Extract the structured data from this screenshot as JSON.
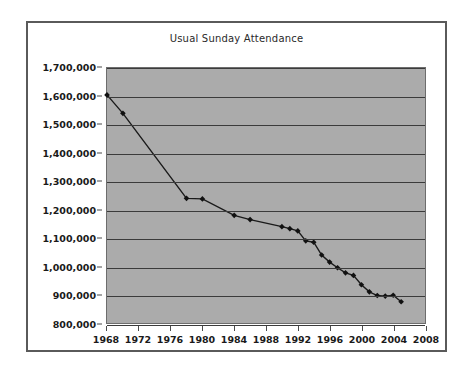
{
  "chart_data": {
    "type": "line",
    "title": "Usual Sunday Attendance",
    "xlabel": "",
    "ylabel": "",
    "xlim": [
      1968,
      2008
    ],
    "ylim": [
      800000,
      1700000
    ],
    "grid": true,
    "legend": "none",
    "background_color": "#ababab",
    "line_color": "#1a1a1a",
    "marker_color": "#111111",
    "x_tick_labels": [
      "1968",
      "1972",
      "1976",
      "1980",
      "1984",
      "1988",
      "1992",
      "1996",
      "2000",
      "2004",
      "2008"
    ],
    "x_ticks": [
      1968,
      1972,
      1976,
      1980,
      1984,
      1988,
      1992,
      1996,
      2000,
      2004,
      2008
    ],
    "y_tick_labels": [
      "800,000",
      "900,000",
      "1,000,000",
      "1,100,000",
      "1,200,000",
      "1,300,000",
      "1,400,000",
      "1,500,000",
      "1,600,000",
      "1,700,000"
    ],
    "y_ticks": [
      800000,
      900000,
      1000000,
      1100000,
      1200000,
      1300000,
      1400000,
      1500000,
      1600000,
      1700000
    ],
    "series": [
      {
        "name": "Usual Sunday Attendance",
        "x": [
          1968,
          1970,
          1978,
          1980,
          1984,
          1986,
          1990,
          1991,
          1992,
          1993,
          1994,
          1995,
          1996,
          1997,
          1998,
          1999,
          2000,
          2001,
          2002,
          2003,
          2004,
          2005
        ],
        "values": [
          1605000,
          1540000,
          1240000,
          1238000,
          1180000,
          1165000,
          1140000,
          1133000,
          1125000,
          1090000,
          1085000,
          1040000,
          1015000,
          995000,
          977000,
          968000,
          935000,
          910000,
          897000,
          895000,
          898000,
          875000
        ]
      }
    ]
  }
}
